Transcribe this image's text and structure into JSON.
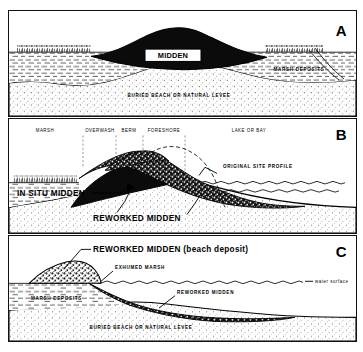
{
  "figure": {
    "background": "#ffffff",
    "ink": "#000000"
  },
  "panels": [
    {
      "letter": "A",
      "name": "panel-a",
      "caption": "Intact midden mound on buried beach",
      "labels": {
        "midden": "MIDDEN",
        "marsh_deposits": "MARSH DEPOSITS",
        "buried_beach": "BURIED BEACH OR NATURAL LEVEE"
      }
    },
    {
      "letter": "B",
      "name": "panel-b",
      "caption": "Shoreline erosion reworking the midden",
      "zones": [
        "MARSH",
        "OVERWASH",
        "BERM",
        "FORESHORE",
        "LAKE OR BAY"
      ],
      "labels": {
        "original_profile": "ORIGINAL SITE PROFILE",
        "in_situ_midden": "IN SITU MIDDEN",
        "reworked_midden": "REWORKED MIDDEN"
      }
    },
    {
      "letter": "C",
      "name": "panel-c",
      "caption": "Fully reworked midden as beach deposit",
      "labels": {
        "reworked_beach_deposit": "REWORKED MIDDEN (beach deposit)",
        "exhumed_marsh": "EXHUMED MARSH",
        "water_surface": "water surface",
        "reworked_midden": "REWORKED MIDDEN",
        "marsh_deposits": "MARSH DEPOSITS",
        "buried_beach": "BURIED BEACH OR NATURAL LEVEE"
      }
    }
  ]
}
